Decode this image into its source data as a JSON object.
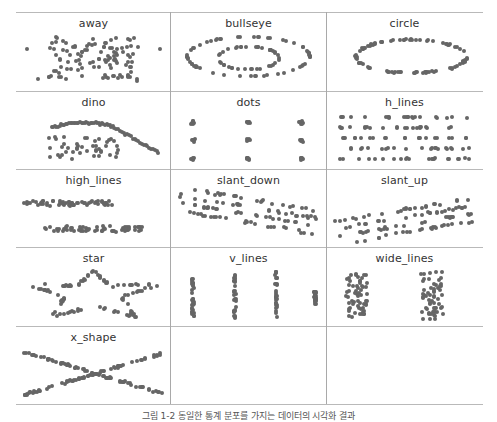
{
  "caption": "그림 1-2 동일한 통계 분포를 가지는 데이터의 시각화 결과",
  "chart_data": {
    "type": "scatter",
    "title": "",
    "layout": {
      "rows": 5,
      "cols": 3,
      "grid_lines": true,
      "axes": false,
      "dot_color": "#666666"
    },
    "panels": [
      {
        "name": "away"
      },
      {
        "name": "bullseye"
      },
      {
        "name": "circle"
      },
      {
        "name": "dino"
      },
      {
        "name": "dots"
      },
      {
        "name": "h_lines"
      },
      {
        "name": "high_lines"
      },
      {
        "name": "slant_down"
      },
      {
        "name": "slant_up"
      },
      {
        "name": "star"
      },
      {
        "name": "v_lines"
      },
      {
        "name": "wide_lines"
      },
      {
        "name": "x_shape"
      }
    ]
  }
}
